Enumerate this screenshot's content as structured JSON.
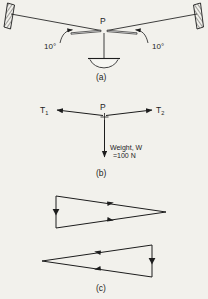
{
  "figure": {
    "background_color": "#f2f1ec",
    "ink_color": "#1d1d1d",
    "parts": [
      {
        "id": "a",
        "caption": "(a)",
        "description": "Lamp hanging at point P from two cords attached to walls",
        "labels": {
          "junction": "P",
          "angle_left": "10°",
          "angle_right": "10°"
        }
      },
      {
        "id": "b",
        "caption": "(b)",
        "description": "Free-body diagram of forces acting at point P",
        "labels": {
          "junction": "P",
          "tension_left_symbol": "T",
          "tension_left_sub": "1",
          "tension_right_symbol": "T",
          "tension_right_sub": "2",
          "weight_line1": "Weight, W",
          "weight_line2": "=100 N"
        }
      },
      {
        "id": "c",
        "caption": "(c)",
        "description": "Two closed vector (force) triangles drawn for the tensions and weight"
      }
    ],
    "captions": {
      "a": "(a)",
      "b": "(b)",
      "c": "(c)"
    }
  }
}
